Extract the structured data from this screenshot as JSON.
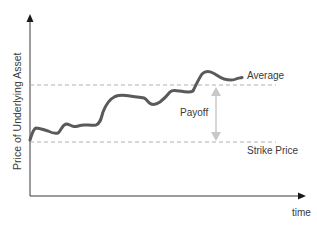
{
  "diagram": {
    "y_axis_label": "Price of Underlying Asset",
    "x_axis_label": "time",
    "levels": {
      "average_label": "Average",
      "strike_label": "Strike Price"
    },
    "payoff_label": "Payoff",
    "colors": {
      "price_line": "#5a5a5a",
      "dashed_lines": "#b0b0b0",
      "payoff_arrow": "#c8c8c8",
      "axes": "#3a3a3a",
      "text": "#3a3a3a"
    }
  }
}
